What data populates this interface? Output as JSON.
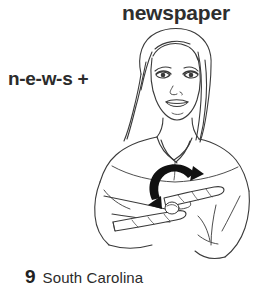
{
  "page": {
    "background_color": "#ffffff",
    "width": 275,
    "height": 292
  },
  "title": {
    "word": "newspaper",
    "color": "#2e2e2e"
  },
  "gloss": {
    "text": "n-e-w-s +",
    "color": "#2b2b2b"
  },
  "caption": {
    "number": "9",
    "label": "South Carolina",
    "number_color": "#222222",
    "label_color": "#2b2b2b"
  },
  "illustration": {
    "name": "sign-language-newspaper-illustration",
    "subject": "woman signing newspaper",
    "line_color": "#3a3a3a",
    "arrow_color": "#111111",
    "description": "Line drawing of a woman with long hair, both hands held flat in front of her chest, with a thick curved double-headed motion arrow indicating the repeated thumb-to-palm movement."
  }
}
